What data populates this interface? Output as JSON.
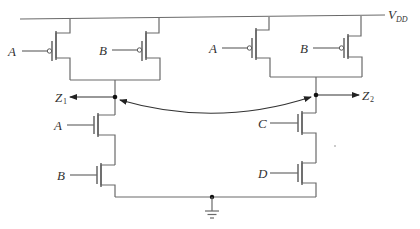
{
  "diagram": {
    "type": "CMOS circuit schematic",
    "supply": {
      "label": "V",
      "subscript": "DD"
    },
    "outputs": [
      {
        "label": "Z",
        "subscript": "1"
      },
      {
        "label": "Z",
        "subscript": "2"
      }
    ],
    "pull_up_left": {
      "gates": [
        "A",
        "B"
      ],
      "type": "PMOS parallel"
    },
    "pull_up_right": {
      "gates": [
        "A",
        "B"
      ],
      "type": "PMOS parallel"
    },
    "pull_down_left": {
      "gates": [
        "A",
        "B"
      ],
      "type": "NMOS series"
    },
    "pull_down_right": {
      "gates": [
        "C",
        "D"
      ],
      "type": "NMOS series"
    },
    "ground": "ground-symbol",
    "connector": "double-headed curved arrow between Z1 and Z2 nodes",
    "colors": {
      "wire": "#6a6a6a",
      "node": "#111111",
      "background": "#ffffff"
    }
  },
  "labels": {
    "pmos_l_a": "A",
    "pmos_l_b": "B",
    "pmos_r_a": "A",
    "pmos_r_b": "B",
    "nmos_l_a": "A",
    "nmos_l_b": "B",
    "nmos_r_c": "C",
    "nmos_r_d": "D",
    "z1": "Z",
    "z1_sub": "1",
    "z2": "Z",
    "z2_sub": "2",
    "vdd": "V",
    "vdd_sub": "DD"
  }
}
